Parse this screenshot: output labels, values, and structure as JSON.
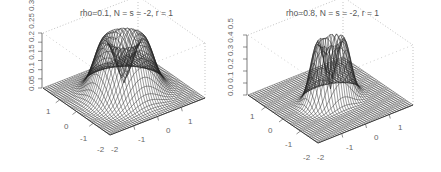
{
  "chart_data": [
    {
      "type": "surface3d",
      "title": "rho=0.1, N = s = -2, r = 1",
      "xlabel": "",
      "ylabel": "",
      "zlabel": "",
      "x_ticks": [
        "-2",
        "-1",
        "0",
        "1"
      ],
      "y_ticks": [
        "-2",
        "-1",
        "0",
        "1"
      ],
      "z_ticks": [
        "0.0",
        "0.05",
        "0.1",
        "0.15",
        "0.2",
        "0.25",
        "0.3"
      ],
      "z_axis_label_text": "0.05 0.1 0.15 0.2 0.25 0.3",
      "xlim": [
        -2,
        2
      ],
      "ylim": [
        -2,
        2
      ],
      "zlim": [
        0,
        0.3
      ],
      "surface": "ring-shaped (volcano) density, crater at center, peak ~0.3 at radius ~0.6",
      "peak_radius": 0.65,
      "ring_width": 0.55,
      "peak_z": 0.3,
      "wireframe": true,
      "box": true,
      "grid": false
    },
    {
      "type": "surface3d",
      "title": "rho=0.8, N = s = -2, r = 1",
      "xlabel": "",
      "ylabel": "",
      "zlabel": "",
      "x_ticks": [
        "-2",
        "-1",
        "0",
        "1"
      ],
      "y_ticks": [
        "-2",
        "-1",
        "0",
        "1"
      ],
      "z_ticks": [
        "0.0",
        "0.1",
        "0.2",
        "0.3",
        "0.4",
        "0.5"
      ],
      "z_axis_label_text": "0.0 0.1 0.2 0.3 0.4 0.5",
      "xlim": [
        -2,
        2
      ],
      "ylim": [
        -2,
        2
      ],
      "zlim": [
        0,
        0.5
      ],
      "surface": "elongated ridge-shaped density with narrow crater, peak ~0.5",
      "peak_radius": 0.45,
      "ring_width": 0.38,
      "peak_z": 0.5,
      "wireframe": true,
      "box": true,
      "grid": false
    }
  ],
  "panels": [
    {
      "title": "rho=0.1, N = s = -2, r = 1",
      "z_label": "0.05 0.1 0.15 0.2 0.25 0.3",
      "z_label_prefix": "0",
      "left_ticks": [
        "1",
        "0",
        "-1",
        "-2"
      ],
      "right_ticks": [
        "-2",
        "-1",
        "0",
        "1"
      ]
    },
    {
      "title": "rho=0.8, N = s = -2, r = 1",
      "z_label": "0.0 0.1 0.2 0.3 0.4 0.5",
      "left_ticks": [
        "1",
        "0",
        "-1",
        "-2"
      ],
      "right_ticks": [
        "-2",
        "-1",
        "0",
        "1"
      ]
    }
  ],
  "colors": {
    "wire": "#222222",
    "box": "#9a9a9a",
    "text": "#555555",
    "background": "#ffffff"
  }
}
